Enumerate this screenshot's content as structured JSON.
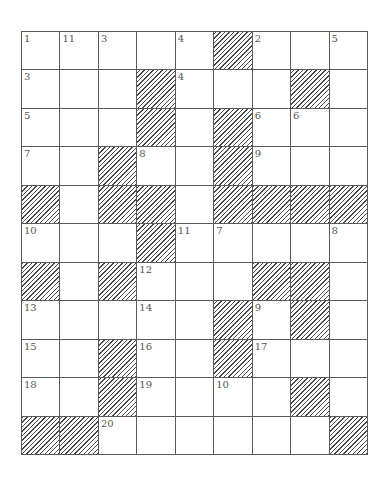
{
  "puzzle": {
    "columns": 9,
    "rows": 11,
    "colors": {
      "line": "#5a5a5a",
      "hatch": "#4a4a4a",
      "number": "#555555",
      "background": "#ffffff"
    },
    "grid": [
      [
        "1",
        "11",
        "3",
        "",
        "4",
        "#",
        "2",
        "",
        "5"
      ],
      [
        "3",
        "",
        "",
        "#",
        "4",
        "",
        "",
        "#",
        ""
      ],
      [
        "5",
        "",
        "",
        "#",
        "",
        "#",
        "6",
        "6",
        ""
      ],
      [
        "7",
        "",
        "#",
        "8",
        "",
        "#",
        "9",
        "",
        ""
      ],
      [
        "#",
        "",
        "#",
        "#",
        "",
        "#",
        "#",
        "#",
        "#"
      ],
      [
        "10",
        "",
        "",
        "#",
        "11",
        "7",
        "",
        "",
        "8"
      ],
      [
        "#",
        "",
        "#",
        "12",
        "",
        "",
        "#",
        "#",
        ""
      ],
      [
        "13",
        "",
        "",
        "14",
        "",
        "#",
        "9",
        "#",
        ""
      ],
      [
        "15",
        "",
        "#",
        "16",
        "",
        "#",
        "17",
        "",
        ""
      ],
      [
        "18",
        "",
        "#",
        "19",
        "",
        "10",
        "",
        "#",
        ""
      ],
      [
        "#",
        "#",
        "20",
        "",
        "",
        "",
        "",
        "",
        "#"
      ]
    ]
  }
}
